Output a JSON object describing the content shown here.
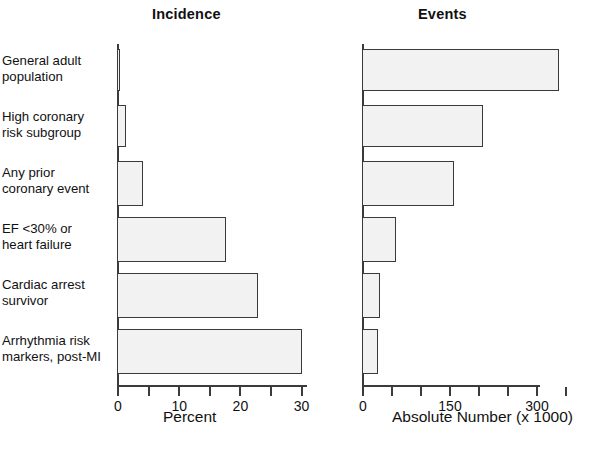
{
  "figure": {
    "panels": [
      {
        "key": "incidence",
        "title": "Incidence"
      },
      {
        "key": "events",
        "title": "Events"
      }
    ],
    "categories": [
      "General adult population",
      "High coronary risk subgroup",
      "Any prior coronary event",
      "EF <30% or heart failure",
      "Cardiac arrest survivor",
      "Arrhythmia risk markers, post-MI"
    ],
    "category_lines": [
      [
        "General adult",
        "population"
      ],
      [
        "High coronary",
        "risk subgroup"
      ],
      [
        "Any prior",
        "coronary event"
      ],
      [
        "EF <30% or",
        "heart failure"
      ],
      [
        "Cardiac arrest",
        "survivor"
      ],
      [
        "Arrhythmia risk",
        "markers, post-MI"
      ]
    ],
    "bar_fill": "#f2f2f2",
    "bar_stroke": "#3a3a3a",
    "axis_color": "#3b3b3b"
  },
  "chart_data": [
    {
      "type": "bar",
      "title": "Incidence",
      "orientation": "horizontal",
      "xlabel": "Percent",
      "ylabel": "",
      "categories": [
        "General adult population",
        "High coronary risk subgroup",
        "Any prior coronary event",
        "EF <30% or heart failure",
        "Cardiac arrest survivor",
        "Arrhythmia risk markers, post-MI"
      ],
      "values": [
        0.5,
        1.4,
        4.2,
        17.8,
        23.0,
        30.2
      ],
      "xlim": [
        0,
        31
      ],
      "xticks": [
        0,
        5,
        10,
        15,
        20,
        25,
        30
      ],
      "xtick_labels": [
        "0",
        "",
        "10",
        "",
        "20",
        "",
        "30"
      ],
      "grid": false,
      "legend": "none"
    },
    {
      "type": "bar",
      "title": "Events",
      "orientation": "horizontal",
      "xlabel": "Absolute Number (x 1000)",
      "ylabel": "",
      "categories": [
        "General adult population",
        "High coronary risk subgroup",
        "Any prior coronary event",
        "EF <30% or heart failure",
        "Cardiac arrest survivor",
        "Arrhythmia risk markers, post-MI"
      ],
      "values": [
        340,
        208,
        159,
        59,
        31,
        28
      ],
      "xlim": [
        0,
        350
      ],
      "xticks": [
        0,
        50,
        100,
        150,
        200,
        250,
        300,
        350
      ],
      "xtick_labels": [
        "0",
        "",
        "",
        "150",
        "",
        "",
        "300",
        ""
      ],
      "grid": false,
      "legend": "none"
    }
  ]
}
